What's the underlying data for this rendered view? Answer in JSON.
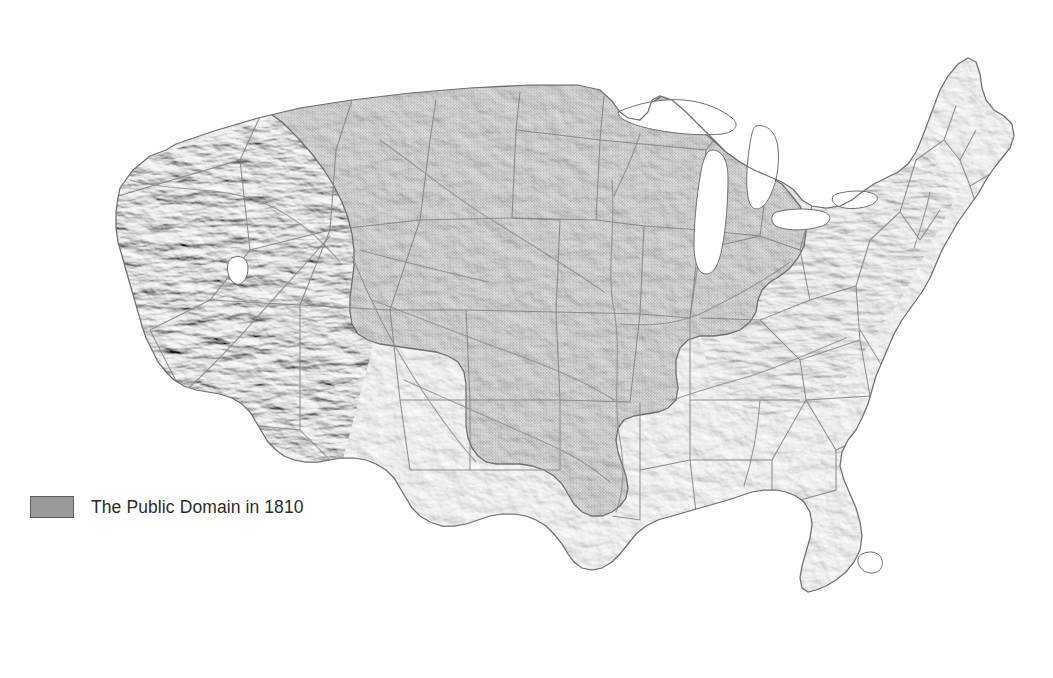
{
  "figure": {
    "kind": "shaded-relief-map",
    "region": "Contiguous United States",
    "background_color": "#ffffff",
    "land_color": "#d8d8d8",
    "land_outline_color": "#6f6f6f",
    "water_color": "#ffffff",
    "border_color": "#8a8a8a",
    "river_color": "#8e8e8e",
    "highlight_fill": "#a9a9a9",
    "highlight_outline": "#5a5a5a"
  },
  "legend": {
    "swatch_color": "#9a9a9a",
    "swatch_border_color": "#5d5d5d",
    "label": "The Public Domain in 1810"
  },
  "highlight": {
    "name": "The Public Domain in 1810",
    "description": "Federal public domain lands shaded darker",
    "areas": [
      "Old Northwest (Ohio, Indiana, Illinois, Michigan, Wisconsin)",
      "Louisiana Purchase interior and Upper Plains",
      "Mississippi Territory (Mississippi and Alabama)",
      "Orleans Territory (Louisiana)"
    ]
  },
  "unshaded": {
    "areas": [
      "Pacific Coast and Great Basin",
      "Texas",
      "Florida",
      "Original Atlantic seaboard states",
      "New England"
    ]
  },
  "water_features": [
    "Lake Superior",
    "Lake Michigan",
    "Lake Huron",
    "Lake Erie",
    "Lake Ontario",
    "Great Salt Lake",
    "Lake Okeechobee"
  ]
}
